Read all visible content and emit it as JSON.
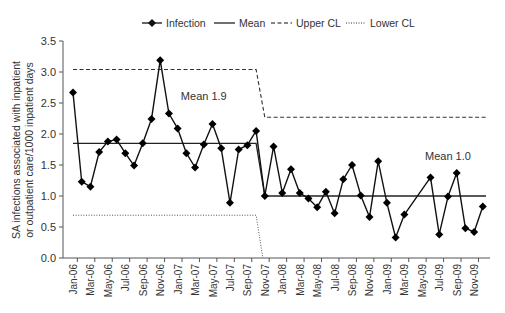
{
  "chart_data": {
    "type": "line",
    "title": "",
    "xlabel": "",
    "ylabel": "SA infections associated with inpatient or outpatient care/1000 inpatient days",
    "ylabel_lines": [
      "SA infections associated with inpatient",
      "or outpatient care/1000 inpatient days"
    ],
    "ylim": [
      0,
      3.5
    ],
    "yticks": [
      "0.0",
      "0.5",
      "1.0",
      "1.5",
      "2.0",
      "2.5",
      "3.0",
      "3.5"
    ],
    "grid": false,
    "legend_position": "top",
    "legend": [
      "Infection",
      "Mean",
      "Upper CL",
      "Lower CL"
    ],
    "x": [
      "Jan-06",
      "Feb-06",
      "Mar-06",
      "Apr-06",
      "May-06",
      "Jun-06",
      "Jul-06",
      "Aug-06",
      "Sep-06",
      "Oct-06",
      "Nov-06",
      "Dec-06",
      "Jan-07",
      "Feb-07",
      "Mar-07",
      "Apr-07",
      "May-07",
      "Jun-07",
      "Jul-07",
      "Aug-07",
      "Sep-07",
      "Oct-07",
      "Nov-07",
      "Dec-07",
      "Jan-08",
      "Feb-08",
      "Mar-08",
      "Apr-08",
      "May-08",
      "Jun-08",
      "Jul-08",
      "Aug-08",
      "Sep-08",
      "Oct-08",
      "Nov-08",
      "Dec-08",
      "Jan-09",
      "Feb-09",
      "Mar-09",
      "Apr-09",
      "May-09",
      "Jun-09",
      "Jul-09",
      "Aug-09",
      "Sep-09",
      "Oct-09",
      "Nov-09",
      "Dec-09"
    ],
    "xtick_labels": [
      "Jan-06",
      "Mar-06",
      "May-06",
      "Jul-06",
      "Sep-06",
      "Nov-06",
      "Jan-07",
      "Mar-07",
      "May-07",
      "Jul-07",
      "Sep-07",
      "Nov-07",
      "Jan-08",
      "Mar-08",
      "May-08",
      "Jul-08",
      "Sep-08",
      "Nov-08",
      "Jan-09",
      "Mar-09",
      "May-09",
      "Jul-09",
      "Sep-09",
      "Nov-09"
    ],
    "series": [
      {
        "name": "Infection",
        "style": "line-diamond",
        "values": [
          2.67,
          1.23,
          1.15,
          1.71,
          1.88,
          1.91,
          1.69,
          1.49,
          1.85,
          2.24,
          3.19,
          2.33,
          2.09,
          1.69,
          1.46,
          1.83,
          2.16,
          1.77,
          0.89,
          1.75,
          1.82,
          2.05,
          1.0,
          1.8,
          1.05,
          1.43,
          1.05,
          0.96,
          0.82,
          1.07,
          0.72,
          1.27,
          1.5,
          1.01,
          0.66,
          1.56,
          0.89,
          0.33,
          0.7,
          null,
          null,
          1.3,
          0.38,
          0.99,
          1.37,
          0.48,
          0.42,
          0.83
        ]
      },
      {
        "name": "Mean",
        "style": "solid",
        "segments": [
          {
            "from": "Jan-06",
            "to": "Oct-07",
            "value": 1.85
          },
          {
            "from": "Nov-07",
            "to": "Dec-09",
            "value": 1.0
          }
        ]
      },
      {
        "name": "Upper CL",
        "style": "dashed",
        "segments": [
          {
            "from": "Jan-06",
            "to": "Oct-07",
            "value": 3.04
          },
          {
            "from": "Nov-07",
            "to": "Dec-09",
            "value": 2.27
          }
        ]
      },
      {
        "name": "Lower CL",
        "style": "dotted",
        "segments": [
          {
            "from": "Jan-06",
            "to": "Oct-07",
            "value": 0.69
          },
          {
            "from": "Nov-07",
            "to": "Dec-09",
            "value": 0.0
          }
        ]
      }
    ],
    "annotations": [
      {
        "text": "Mean 1.9",
        "x": "Apr-07",
        "y": 2.55
      },
      {
        "text": "Mean 1.0",
        "x": "Aug-09",
        "y": 1.58
      }
    ]
  }
}
